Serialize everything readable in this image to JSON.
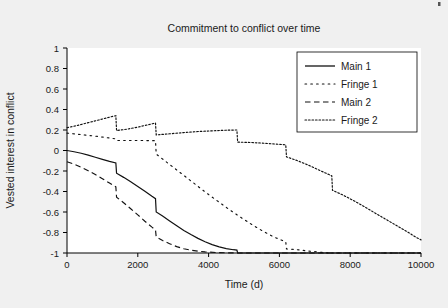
{
  "figure": {
    "background_color": "#f0f0f0",
    "plot_background_color": "#ffffff",
    "axis_color": "#000000",
    "series_color": "#111111"
  },
  "chart_data": {
    "type": "line",
    "title": "Commitment to conflict over time",
    "xlabel": "Time (d)",
    "ylabel": "Vested interest in conflict",
    "xlim": [
      0,
      10000
    ],
    "ylim": [
      -1,
      1
    ],
    "xticks": [
      0,
      2000,
      4000,
      6000,
      8000,
      10000
    ],
    "xtick_labels": [
      "0",
      "2000",
      "4000",
      "6000",
      "8000",
      "10000"
    ],
    "yticks": [
      1,
      0.8,
      0.6,
      0.4,
      0.2,
      0,
      -0.2,
      -0.4,
      -0.6,
      -0.8,
      -1
    ],
    "ytick_labels": [
      "1",
      "0.8",
      "0.6",
      "0.4",
      "0.2",
      "0",
      "-0.2",
      "-0.4",
      "-0.6",
      "-0.8",
      "-1"
    ],
    "grid": false,
    "legend_position": "upper right",
    "series": [
      {
        "name": "Main 1",
        "style": "solid",
        "dash": "none",
        "points": [
          [
            0,
            0.0
          ],
          [
            200,
            -0.012
          ],
          [
            400,
            -0.027
          ],
          [
            600,
            -0.045
          ],
          [
            800,
            -0.066
          ],
          [
            1000,
            -0.086
          ],
          [
            1200,
            -0.106
          ],
          [
            1380,
            -0.122
          ],
          [
            1400,
            -0.222
          ],
          [
            1600,
            -0.262
          ],
          [
            1800,
            -0.305
          ],
          [
            2000,
            -0.35
          ],
          [
            2200,
            -0.397
          ],
          [
            2400,
            -0.447
          ],
          [
            2500,
            -0.47
          ],
          [
            2520,
            -0.6
          ],
          [
            2700,
            -0.64
          ],
          [
            2900,
            -0.688
          ],
          [
            3100,
            -0.735
          ],
          [
            3300,
            -0.78
          ],
          [
            3500,
            -0.82
          ],
          [
            3700,
            -0.857
          ],
          [
            3900,
            -0.89
          ],
          [
            4100,
            -0.918
          ],
          [
            4300,
            -0.94
          ],
          [
            4500,
            -0.957
          ],
          [
            4700,
            -0.968
          ],
          [
            4800,
            -0.972
          ],
          [
            4820,
            -1.0
          ],
          [
            10000,
            -1.0
          ]
        ]
      },
      {
        "name": "Fringe 1",
        "style": "dotted-sparse",
        "dash": "1.6,4.2",
        "points": [
          [
            0,
            0.17
          ],
          [
            400,
            0.155
          ],
          [
            800,
            0.14
          ],
          [
            1200,
            0.122
          ],
          [
            1380,
            0.113
          ],
          [
            1400,
            0.098
          ],
          [
            1800,
            0.098
          ],
          [
            2200,
            0.097
          ],
          [
            2500,
            0.096
          ],
          [
            2520,
            -0.035
          ],
          [
            2800,
            -0.11
          ],
          [
            3100,
            -0.19
          ],
          [
            3400,
            -0.27
          ],
          [
            3700,
            -0.35
          ],
          [
            4000,
            -0.43
          ],
          [
            4300,
            -0.505
          ],
          [
            4600,
            -0.58
          ],
          [
            4900,
            -0.65
          ],
          [
            5200,
            -0.718
          ],
          [
            5500,
            -0.78
          ],
          [
            5700,
            -0.818
          ],
          [
            5900,
            -0.852
          ],
          [
            6100,
            -0.88
          ],
          [
            6180,
            -0.89
          ],
          [
            6200,
            -0.96
          ],
          [
            6500,
            -0.968
          ],
          [
            6800,
            -0.98
          ],
          [
            7100,
            -0.99
          ],
          [
            7300,
            -0.998
          ],
          [
            7500,
            -1.0
          ],
          [
            10000,
            -1.0
          ]
        ]
      },
      {
        "name": "Main 2",
        "style": "dashed",
        "dash": "5.5,3.5",
        "points": [
          [
            0,
            -0.11
          ],
          [
            200,
            -0.133
          ],
          [
            400,
            -0.163
          ],
          [
            600,
            -0.197
          ],
          [
            800,
            -0.235
          ],
          [
            1000,
            -0.275
          ],
          [
            1200,
            -0.318
          ],
          [
            1380,
            -0.355
          ],
          [
            1400,
            -0.455
          ],
          [
            1600,
            -0.51
          ],
          [
            1800,
            -0.568
          ],
          [
            2000,
            -0.628
          ],
          [
            2200,
            -0.69
          ],
          [
            2400,
            -0.748
          ],
          [
            2500,
            -0.775
          ],
          [
            2520,
            -0.843
          ],
          [
            2700,
            -0.878
          ],
          [
            2900,
            -0.91
          ],
          [
            3100,
            -0.938
          ],
          [
            3300,
            -0.958
          ],
          [
            3500,
            -0.972
          ],
          [
            3700,
            -0.982
          ],
          [
            3900,
            -0.989
          ],
          [
            4200,
            -0.995
          ],
          [
            4500,
            -0.998
          ],
          [
            4800,
            -1.0
          ],
          [
            10000,
            -1.0
          ]
        ]
      },
      {
        "name": "Fringe 2",
        "style": "dotted-dense",
        "dash": "1.6,1.9",
        "points": [
          [
            0,
            0.222
          ],
          [
            300,
            0.245
          ],
          [
            600,
            0.272
          ],
          [
            900,
            0.298
          ],
          [
            1200,
            0.325
          ],
          [
            1380,
            0.34
          ],
          [
            1400,
            0.195
          ],
          [
            1700,
            0.208
          ],
          [
            2000,
            0.228
          ],
          [
            2300,
            0.252
          ],
          [
            2500,
            0.268
          ],
          [
            2520,
            0.152
          ],
          [
            2900,
            0.163
          ],
          [
            3300,
            0.175
          ],
          [
            3700,
            0.185
          ],
          [
            4100,
            0.192
          ],
          [
            4500,
            0.198
          ],
          [
            4800,
            0.2
          ],
          [
            4820,
            0.082
          ],
          [
            5200,
            0.078
          ],
          [
            5600,
            0.07
          ],
          [
            6000,
            0.06
          ],
          [
            6180,
            0.055
          ],
          [
            6200,
            -0.062
          ],
          [
            6500,
            -0.098
          ],
          [
            6800,
            -0.14
          ],
          [
            7100,
            -0.188
          ],
          [
            7400,
            -0.235
          ],
          [
            7480,
            -0.248
          ],
          [
            7500,
            -0.388
          ],
          [
            7800,
            -0.435
          ],
          [
            8100,
            -0.49
          ],
          [
            8400,
            -0.548
          ],
          [
            8700,
            -0.61
          ],
          [
            9000,
            -0.67
          ],
          [
            9300,
            -0.73
          ],
          [
            9600,
            -0.79
          ],
          [
            9850,
            -0.845
          ],
          [
            10000,
            -0.872
          ]
        ]
      }
    ],
    "legend": [
      {
        "label": "Main 1",
        "style": "solid"
      },
      {
        "label": "Fringe 1",
        "style": "dotted-sparse"
      },
      {
        "label": "Main 2",
        "style": "dashed"
      },
      {
        "label": "Fringe 2",
        "style": "dotted-dense"
      }
    ]
  }
}
